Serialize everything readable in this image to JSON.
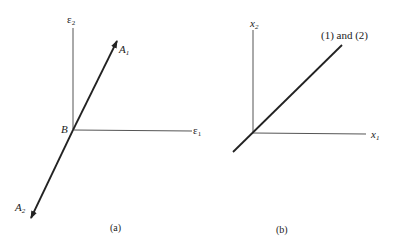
{
  "panel_a": {
    "axis_vertical_label": "ε",
    "axis_vertical_sub": "2",
    "axis_horizontal_label": "ε",
    "axis_horizontal_sub": "1",
    "origin_label": "B",
    "vector_up_label": "A",
    "vector_up_sub": "1",
    "vector_down_label": "A",
    "vector_down_sub": "2",
    "caption": "(a)"
  },
  "panel_b": {
    "axis_vertical_label": "x",
    "axis_vertical_sub": "2",
    "axis_horizontal_label": "x",
    "axis_horizontal_sub": "1",
    "line_label": "(1) and (2)",
    "caption": "(b)"
  },
  "colors": {
    "line": "#222222",
    "axis": "#555555",
    "background": "#ffffff"
  }
}
